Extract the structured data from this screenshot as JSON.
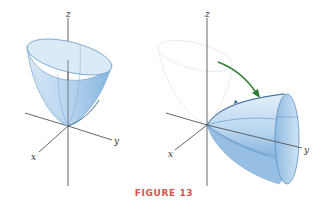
{
  "caption": "FIGURE 13",
  "colors": {
    "caption": "#d9534f",
    "surface_fill": "#a9cdea",
    "surface_dark": "#6fa6d6",
    "surface_edge": "#5b8fc0",
    "axis": "#555555",
    "arrow": "#2e7d32",
    "ghost": "#d6dde4"
  },
  "left_panel": {
    "description": "Paraboloid opening upward along z-axis",
    "axes": {
      "x": "x",
      "y": "y",
      "z": "z"
    }
  },
  "right_panel": {
    "description": "Same paraboloid rotated to open along y-axis; faded original with green rotation arrow",
    "axes": {
      "x": "x",
      "y": "y",
      "z": "z"
    },
    "arrow": "rotation-arrow"
  }
}
